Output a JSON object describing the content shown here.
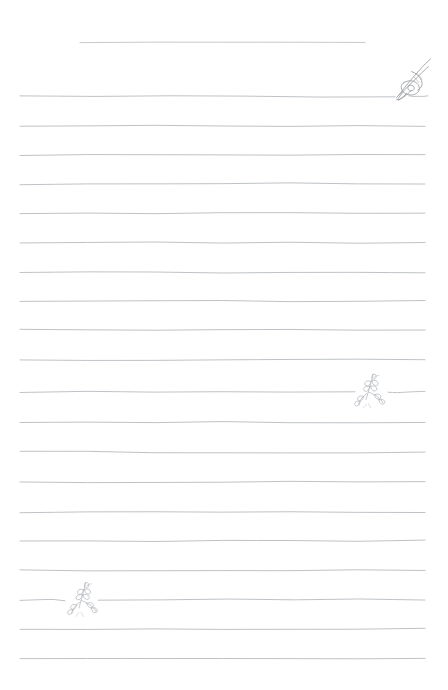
{
  "page": {
    "width": 448,
    "height": 690,
    "background_color": "#ffffff",
    "style_name": "hand-drawn-lined-notepaper",
    "title_text": "",
    "body_text": ""
  },
  "colors": {
    "paper": "#ffffff",
    "rule_line": "#b9bdc1",
    "rule_line_light": "#c9cdd1",
    "sketch_ink": "#9a9ea3",
    "sketch_ink_light": "#b4b8bd"
  },
  "ruling": {
    "line_color": "#b9bdc1",
    "line_width": 1,
    "left_margin": 20,
    "right_margin": 425,
    "pitch": 29.2,
    "first_line_y": 96,
    "line_count": 20
  },
  "title_rule": {
    "name": "title-rule",
    "x_start": 80,
    "x_end": 365,
    "y": 43,
    "color": "#c3c7cb"
  },
  "lines": [
    {
      "index": 1,
      "y": 96,
      "x_start": 20,
      "x_end": 395,
      "gap": true,
      "gap_resume_x": 409,
      "gap_end_x": 428
    },
    {
      "index": 2,
      "y": 125.5,
      "x_start": 20,
      "x_end": 425,
      "gap": false
    },
    {
      "index": 3,
      "y": 155,
      "x_start": 20,
      "x_end": 425,
      "gap": false
    },
    {
      "index": 4,
      "y": 184,
      "x_start": 20,
      "x_end": 425,
      "gap": false
    },
    {
      "index": 5,
      "y": 213,
      "x_start": 20,
      "x_end": 425,
      "gap": false
    },
    {
      "index": 6,
      "y": 242.5,
      "x_start": 20,
      "x_end": 425,
      "gap": false
    },
    {
      "index": 7,
      "y": 272,
      "x_start": 20,
      "x_end": 425,
      "gap": false
    },
    {
      "index": 8,
      "y": 301,
      "x_start": 20,
      "x_end": 425,
      "gap": false
    },
    {
      "index": 9,
      "y": 330,
      "x_start": 20,
      "x_end": 425,
      "gap": false
    },
    {
      "index": 10,
      "y": 360,
      "x_start": 20,
      "x_end": 425,
      "gap": false
    },
    {
      "index": 11,
      "y": 392,
      "x_start": 20,
      "x_end": 355,
      "gap": true,
      "gap_resume_x": 388,
      "gap_end_x": 425
    },
    {
      "index": 12,
      "y": 422,
      "x_start": 20,
      "x_end": 425,
      "gap": false
    },
    {
      "index": 13,
      "y": 452,
      "x_start": 20,
      "x_end": 425,
      "gap": false
    },
    {
      "index": 14,
      "y": 482,
      "x_start": 20,
      "x_end": 425,
      "gap": false
    },
    {
      "index": 15,
      "y": 512,
      "x_start": 20,
      "x_end": 425,
      "gap": false
    },
    {
      "index": 16,
      "y": 541,
      "x_start": 20,
      "x_end": 425,
      "gap": false
    },
    {
      "index": 17,
      "y": 570.5,
      "x_start": 20,
      "x_end": 425,
      "gap": false
    },
    {
      "index": 18,
      "y": 600,
      "x_start": 20,
      "x_end": 65,
      "gap": true,
      "gap_resume_x": 98,
      "gap_end_x": 425
    },
    {
      "index": 19,
      "y": 629,
      "x_start": 20,
      "x_end": 425,
      "gap": false
    },
    {
      "index": 20,
      "y": 658,
      "x_start": 20,
      "x_end": 425,
      "gap": false
    }
  ],
  "decorations": [
    {
      "name": "fountain-pen-nib-sketch",
      "icon": "pen-nib-icon",
      "description": "Fountain pen nib drawn in light pencil line, tip resting on the first ruled line, shaft angled up to the right",
      "x": 390,
      "y": 55,
      "width": 44,
      "height": 48,
      "anchor_line_index": 1,
      "color": "#9a9ea3"
    },
    {
      "name": "leaf-sprig-right",
      "icon": "leaf-sprig-icon",
      "description": "Small leafy branch sprig sitting on the ruled line, right side of page",
      "x": 355,
      "y": 374,
      "width": 34,
      "height": 34,
      "anchor_line_index": 11,
      "color": "#b4b8bd"
    },
    {
      "name": "leaf-sprig-left",
      "icon": "leaf-sprig-icon",
      "description": "Small leafy branch sprig sitting on the ruled line, left side of page",
      "x": 64,
      "y": 582,
      "width": 34,
      "height": 34,
      "anchor_line_index": 18,
      "color": "#b4b8bd"
    }
  ]
}
